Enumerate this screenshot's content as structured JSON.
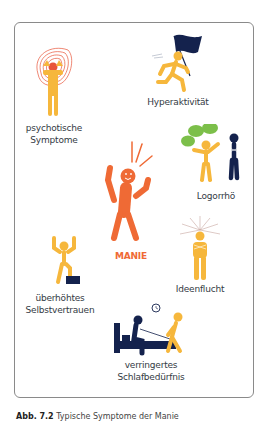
{
  "figure": {
    "center": {
      "label": "MANIE",
      "color": "#ef6a35"
    },
    "symptoms": [
      {
        "id": "psychotic",
        "label_lines": [
          "psychotische",
          "Symptome"
        ]
      },
      {
        "id": "hyperactivity",
        "label_lines": [
          "Hyperaktivität"
        ]
      },
      {
        "id": "logorrhea",
        "label_lines": [
          "Logorrhö"
        ]
      },
      {
        "id": "flight-of-ideas",
        "label_lines": [
          "Ideenflucht"
        ]
      },
      {
        "id": "self-confidence",
        "label_lines": [
          "überhöhtes",
          "Selbstvertrauen"
        ]
      },
      {
        "id": "sleep",
        "label_lines": [
          "verringertes",
          "Schlafbedürfnis"
        ]
      }
    ],
    "colors": {
      "figure_yellow": "#f6b73c",
      "navy": "#14224d",
      "green": "#7cbf4a",
      "orange": "#ef6a35",
      "frame": "#8a8a8a"
    }
  },
  "caption": {
    "prefix": "Abb. 7.2",
    "text": "Typische Symptome der Manie"
  }
}
